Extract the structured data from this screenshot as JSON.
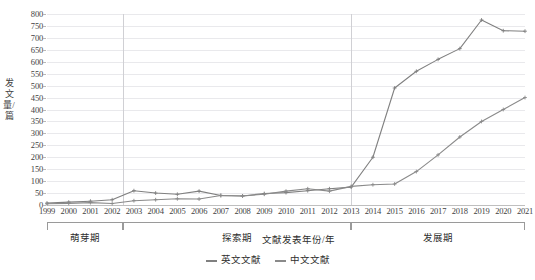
{
  "chart_data": {
    "type": "line",
    "title": "",
    "xlabel": "文献发表年份/年",
    "ylabel": "发文量/篇",
    "x": [
      1999,
      2000,
      2001,
      2002,
      2003,
      2004,
      2005,
      2006,
      2007,
      2008,
      2009,
      2010,
      2011,
      2012,
      2013,
      2014,
      2015,
      2016,
      2017,
      2018,
      2019,
      2020,
      2021
    ],
    "xlim": [
      1999,
      2021
    ],
    "ylim": [
      0,
      800
    ],
    "ytick_step": 50,
    "yticks": [
      0,
      50,
      100,
      150,
      200,
      250,
      300,
      350,
      400,
      450,
      500,
      550,
      600,
      650,
      700,
      750,
      800
    ],
    "xticks": [
      "1999",
      "2000",
      "2001",
      "2002",
      "2003",
      "2004",
      "2005",
      "2006",
      "2007",
      "2008",
      "2009",
      "2010",
      "2011",
      "2012",
      "2013",
      "2014",
      "2015",
      "2016",
      "2017",
      "2018",
      "2019",
      "2020",
      "2021"
    ],
    "grid": true,
    "legend_position": "bottom-center",
    "series": [
      {
        "name": "英文文献",
        "color": "#808080",
        "marker": "cross",
        "values": [
          8,
          12,
          16,
          22,
          60,
          50,
          45,
          58,
          40,
          38,
          48,
          52,
          60,
          68,
          75,
          200,
          490,
          560,
          610,
          655,
          775,
          730,
          728
        ]
      },
      {
        "name": "中文文献",
        "color": "#8a8a8a",
        "marker": "cross",
        "values": [
          5,
          7,
          10,
          6,
          18,
          22,
          26,
          25,
          40,
          38,
          45,
          58,
          68,
          58,
          78,
          85,
          88,
          140,
          210,
          285,
          350,
          400,
          450
        ]
      }
    ],
    "annotations": {
      "dividers": [
        2002.5,
        2013.0
      ],
      "phases": [
        {
          "label": "萌芽期",
          "from": 1999,
          "to": 2002.5
        },
        {
          "label": "探索期",
          "from": 2002.5,
          "to": 2013.0
        },
        {
          "label": "发展期",
          "from": 2013.0,
          "to": 2021
        }
      ]
    }
  },
  "legend": {
    "items": [
      {
        "label": "英文文献"
      },
      {
        "label": "中文文献"
      }
    ]
  }
}
